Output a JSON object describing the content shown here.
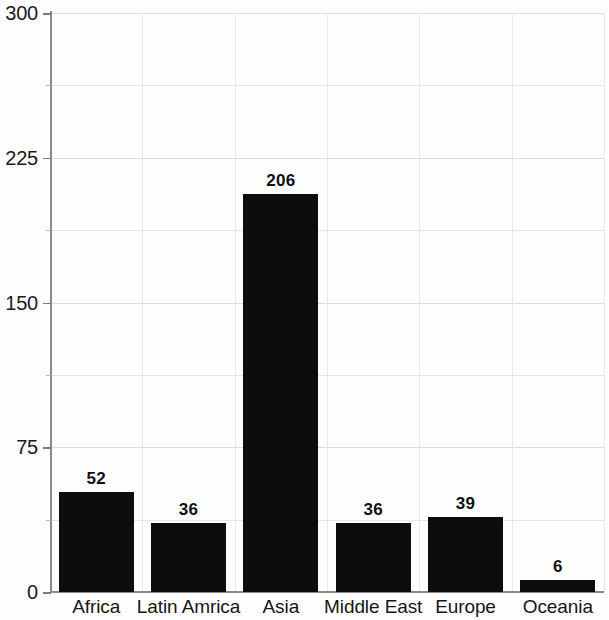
{
  "chart_data": {
    "type": "bar",
    "title": "",
    "subtitle": "",
    "xlabel": "",
    "ylabel": "",
    "categories": [
      "Africa",
      "Latin Amrica",
      "Asia",
      "Middle East",
      "Europe",
      "Oceania"
    ],
    "values": [
      52,
      36,
      206,
      36,
      39,
      6
    ],
    "value_labels": [
      "52",
      "36",
      "206",
      "36",
      "39",
      "6"
    ],
    "ylim": [
      0,
      300
    ],
    "y_ticks": [
      0,
      75,
      150,
      225,
      300
    ],
    "y_tick_labels": [
      "0",
      "75",
      "150",
      "225",
      "300"
    ],
    "y_minor_tick_interval": 37.5,
    "grid": true,
    "grid_axis": "both",
    "legend": "none",
    "bar_color": "#0d0d0d",
    "gridline_color": "#e6e6e6",
    "axis_color": "#8a8a8a",
    "text_color": "#1a1a1a",
    "background_color": "#fefefe",
    "data_labels_shown": true,
    "data_label_position": "above-bar"
  }
}
